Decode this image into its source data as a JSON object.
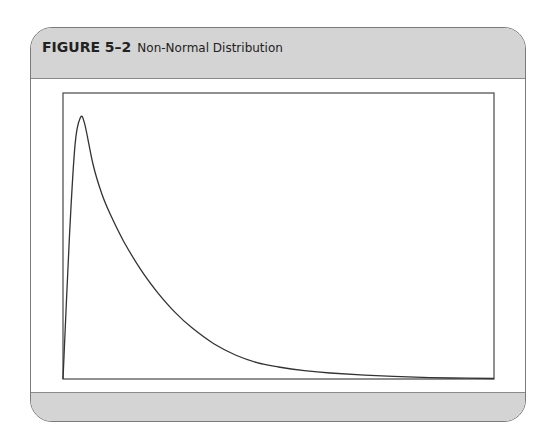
{
  "figure": {
    "number": "FIGURE 5–2",
    "title": "Non-Normal Distribution"
  },
  "colors": {
    "band": "#d4d4d4",
    "line": "#333333",
    "border": "#7a7a7a"
  },
  "chart_data": {
    "type": "line",
    "title": "Non-Normal Distribution",
    "xlabel": "",
    "ylabel": "",
    "xlim": [
      0,
      100
    ],
    "ylim": [
      0,
      100
    ],
    "grid": false,
    "legend": "none",
    "x": [
      0,
      1.5,
      2.8,
      4,
      5,
      7,
      9,
      11,
      14,
      18,
      22,
      26,
      30,
      35,
      40,
      45,
      50,
      56,
      62,
      70,
      80,
      90,
      100
    ],
    "y": [
      0,
      55,
      90,
      100,
      98,
      82,
      71,
      63,
      53,
      42,
      33,
      25.5,
      19.5,
      13.5,
      9.2,
      6.3,
      4.6,
      3.2,
      2.3,
      1.5,
      0.8,
      0.4,
      0.2
    ]
  }
}
